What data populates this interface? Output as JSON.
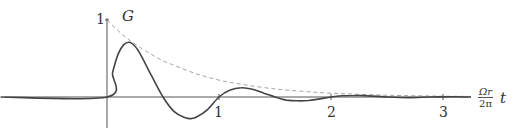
{
  "chart_data": {
    "type": "line",
    "title": "",
    "xlabel": "Ω_r t / 2π",
    "ylabel": "G",
    "xlim": [
      -0.95,
      3.25
    ],
    "ylim": [
      -0.35,
      1.0
    ],
    "x_ticks": [
      "1",
      "2",
      "3"
    ],
    "y_ticks": [
      "1"
    ],
    "grid": false,
    "legend": null,
    "series": [
      {
        "name": "G (damped oscillation)",
        "style": "solid",
        "color": "#444444",
        "x": [
          -0.95,
          0.0,
          0.05,
          0.1,
          0.15,
          0.2,
          0.25,
          0.3,
          0.4,
          0.5,
          0.6,
          0.7,
          0.75,
          0.8,
          0.9,
          1.0,
          1.1,
          1.2,
          1.3,
          1.4,
          1.5,
          1.6,
          1.7,
          1.8,
          1.9,
          2.0,
          2.1,
          2.2,
          2.3,
          2.5,
          2.7,
          2.9,
          3.1,
          3.25
        ],
        "values": [
          0,
          0,
          0.32,
          0.56,
          0.68,
          0.71,
          0.66,
          0.55,
          0.27,
          0.0,
          -0.19,
          -0.27,
          -0.28,
          -0.26,
          -0.16,
          0.0,
          0.09,
          0.12,
          0.1,
          0.05,
          0.0,
          -0.04,
          -0.05,
          -0.045,
          -0.025,
          0.0,
          0.015,
          0.02,
          0.018,
          0.0,
          -0.008,
          0.0,
          0.003,
          0.0
        ]
      },
      {
        "name": "envelope",
        "style": "dashed",
        "color": "#999999",
        "x": [
          0.0,
          0.1,
          0.2,
          0.3,
          0.4,
          0.5,
          0.6,
          0.8,
          1.0,
          1.2,
          1.5,
          1.8,
          2.0,
          2.5,
          3.0,
          3.25
        ],
        "values": [
          1.0,
          0.86,
          0.74,
          0.64,
          0.55,
          0.47,
          0.41,
          0.3,
          0.22,
          0.165,
          0.105,
          0.067,
          0.05,
          0.024,
          0.011,
          0.008
        ]
      }
    ],
    "annotations": [
      "G",
      "Ω_r/2π t"
    ]
  },
  "labels": {
    "y_axis_name": "G",
    "y_tick_1": "1",
    "x_tick_1": "1",
    "x_tick_2": "2",
    "x_tick_3": "3",
    "x_axis_num": "Ωr",
    "x_axis_den": "2π",
    "x_axis_var": "t"
  },
  "colors": {
    "axis": "#555555",
    "curve": "#444444",
    "envelope": "#999999"
  }
}
